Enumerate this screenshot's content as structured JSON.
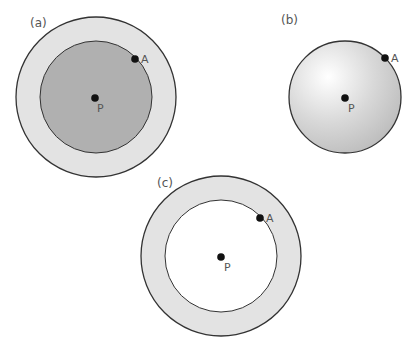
{
  "panels": [
    {
      "label": "(a)",
      "description": "Outer shell (light gray) surrounding a solid inner sphere (darker gray)",
      "center_point": "P",
      "surface_point": "A",
      "outer_fill": "#e3e3e3",
      "inner_fill": "#b0b0b0"
    },
    {
      "label": "(b)",
      "description": "Solid sphere with radial gradient shading",
      "center_point": "P",
      "surface_point": "A",
      "fill_light": "#ffffff",
      "fill_dark": "#bdbdbd"
    },
    {
      "label": "(c)",
      "description": "Hollow spherical shell (light gray ring) with empty interior",
      "center_point": "P",
      "surface_point": "A",
      "outer_fill": "#e3e3e3",
      "inner_fill": "#ffffff"
    }
  ],
  "colors": {
    "stroke": "#333333",
    "dot": "#111111",
    "text": "#555555"
  }
}
